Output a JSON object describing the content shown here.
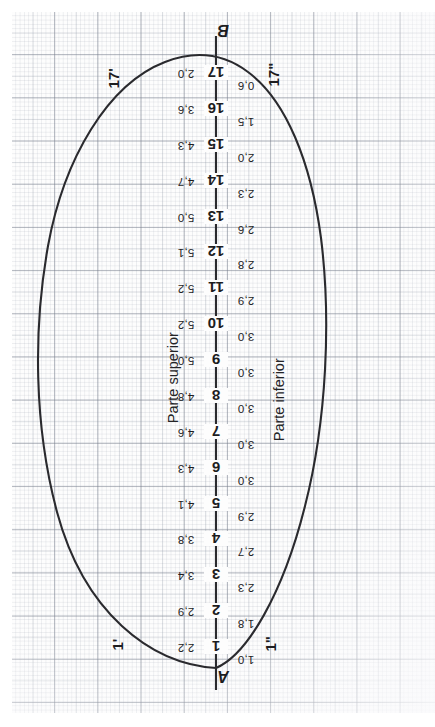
{
  "drawing": {
    "title": "Plano de flotación — semimangas",
    "sheet": "graph-paper",
    "baseline_endpoints": {
      "start": "A",
      "end": "B"
    },
    "side_labels": {
      "upper": "Parte superior",
      "lower": "Parte inferior"
    },
    "corner_labels": {
      "top_left": "17'",
      "top_right": "17\"",
      "bottom_left": "1'",
      "bottom_right": "1\""
    },
    "line_color": "#2a2a2e",
    "grid_color": "#767c8a"
  },
  "chart_data": {
    "type": "line",
    "xlabel": "",
    "ylabel": "",
    "categories": [
      "1",
      "2",
      "3",
      "4",
      "5",
      "6",
      "7",
      "8",
      "9",
      "10",
      "11",
      "12",
      "13",
      "14",
      "15",
      "16",
      "17"
    ],
    "x": [
      1,
      2,
      3,
      4,
      5,
      6,
      7,
      8,
      9,
      10,
      11,
      12,
      13,
      14,
      15,
      16,
      17
    ],
    "series": [
      {
        "name": "Parte superior",
        "values": [
          2.2,
          2.9,
          3.4,
          3.8,
          4.1,
          4.3,
          4.6,
          4.8,
          5.0,
          5.2,
          5.2,
          5.1,
          5.0,
          4.7,
          4.3,
          3.6,
          2.0
        ],
        "labels": [
          "2,2",
          "2,9",
          "3,4",
          "3,8",
          "4,1",
          "4,3",
          "4,6",
          "4,8",
          "5,0",
          "5,2",
          "5,2",
          "5,1",
          "5,0",
          "4,7",
          "4,3",
          "3,6",
          "2,0"
        ]
      },
      {
        "name": "Parte inferior",
        "values": [
          1.0,
          1.8,
          2.3,
          2.7,
          2.9,
          3.0,
          3.0,
          3.0,
          3.0,
          3.0,
          2.9,
          2.8,
          2.6,
          2.3,
          2.0,
          1.5,
          0.6
        ],
        "labels": [
          "1,0",
          "1,8",
          "2,3",
          "2,7",
          "2,9",
          "3,0",
          "3,0",
          "3,0",
          "3,0",
          "3,0",
          "2,9",
          "2,8",
          "2,6",
          "2,3",
          "2,0",
          "1,5",
          "0,6"
        ]
      }
    ],
    "legend_position": "inline-sides",
    "grid": true,
    "axis_endpoints": [
      "A",
      "B"
    ],
    "annotations": [
      "17'",
      "17\"",
      "1'",
      "1\""
    ]
  }
}
